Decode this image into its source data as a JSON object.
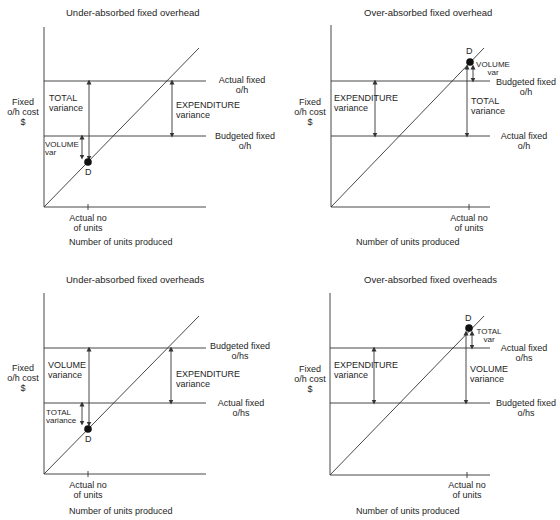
{
  "diagrams": [
    {
      "title": "Under-absorbed fixed overhead",
      "y_axis_label": [
        "Fixed",
        "o/h cost",
        "$"
      ],
      "x_axis_label": "Number of units produced",
      "tick_label": [
        "Actual no",
        "of units"
      ],
      "upper_line_label": [
        "Actual fixed",
        "o/h"
      ],
      "lower_line_label": [
        "Budgeted fixed",
        "o/h"
      ],
      "point_label": "D",
      "expenditure_label": [
        "EXPENDITURE",
        "variance"
      ],
      "total_label": [
        "TOTAL",
        "variance"
      ],
      "volume_label": [
        "VOLUME",
        "var"
      ]
    },
    {
      "title": "Over-absorbed fixed overhead",
      "y_axis_label": [
        "Fixed",
        "o/h cost",
        "$"
      ],
      "x_axis_label": "Number of units produced",
      "tick_label": [
        "Actual no",
        "of units"
      ],
      "upper_line_label": [
        "Budgeted fixed",
        "o/h"
      ],
      "lower_line_label": [
        "Actual fixed",
        "o/h"
      ],
      "point_label": "D",
      "expenditure_label": [
        "EXPENDITURE",
        "variance"
      ],
      "total_label": [
        "TOTAL",
        "variance"
      ],
      "volume_label": [
        "VOLUME",
        "var"
      ]
    },
    {
      "title": "Under-absorbed fixed overheads",
      "y_axis_label": [
        "Fixed",
        "o/h cost",
        "$"
      ],
      "x_axis_label": "Number of units produced",
      "tick_label": [
        "Actual no",
        "of units"
      ],
      "upper_line_label": [
        "Budgeted fixed",
        "o/hs"
      ],
      "lower_line_label": [
        "Actual  fixed",
        "o/hs"
      ],
      "point_label": "D",
      "expenditure_label": [
        "EXPENDITURE",
        "variance"
      ],
      "volume_label": [
        "VOLUME",
        "variance"
      ],
      "total_label": [
        "TOTAL",
        "variance"
      ]
    },
    {
      "title": "Over-absorbed fixed overheads",
      "y_axis_label": [
        "Fixed",
        "o/h cost",
        "$"
      ],
      "x_axis_label": "Number of units produced",
      "tick_label": [
        "Actual no",
        "of units"
      ],
      "upper_line_label": [
        "Actual fixed",
        "o/hs"
      ],
      "lower_line_label": [
        "Budgeted fixed",
        "o/hs"
      ],
      "point_label": "D",
      "expenditure_label": [
        "EXPENDITURE",
        "variance"
      ],
      "volume_label": [
        "VOLUME",
        "variance"
      ],
      "total_label": [
        "TOTAL",
        "var"
      ]
    }
  ],
  "colors": {
    "line": "#333333",
    "text": "#1e1e1e",
    "point": "#111111"
  }
}
